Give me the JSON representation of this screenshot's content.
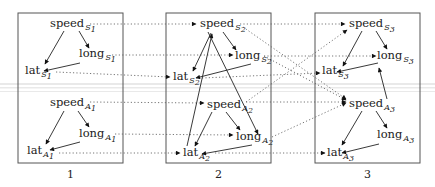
{
  "diagram": {
    "title": "",
    "panels": [
      {
        "id": "p1",
        "label": "1",
        "x": 18,
        "y": 13,
        "w": 105,
        "h": 150
      },
      {
        "id": "p2",
        "label": "2",
        "x": 166,
        "y": 13,
        "w": 105,
        "h": 150
      },
      {
        "id": "p3",
        "label": "3",
        "x": 315,
        "y": 13,
        "w": 105,
        "h": 150
      }
    ],
    "nodes": [
      {
        "id": "speedS1",
        "base": "speed",
        "sub": "S",
        "idx": "1",
        "x": 50,
        "y": 27
      },
      {
        "id": "longS1",
        "base": "long",
        "sub": "S",
        "idx": "1",
        "x": 79,
        "y": 57
      },
      {
        "id": "latS1",
        "base": "lat",
        "sub": "S",
        "idx": "1",
        "x": 25,
        "y": 74
      },
      {
        "id": "speedA1",
        "base": "speed",
        "sub": "A",
        "idx": "1",
        "x": 50,
        "y": 106
      },
      {
        "id": "longA1",
        "base": "long",
        "sub": "A",
        "idx": "1",
        "x": 79,
        "y": 137
      },
      {
        "id": "latA1",
        "base": "lat",
        "sub": "A",
        "idx": "1",
        "x": 27,
        "y": 154
      },
      {
        "id": "speedS2",
        "base": "speed",
        "sub": "S",
        "idx": "2",
        "x": 200,
        "y": 27
      },
      {
        "id": "longS2",
        "base": "long",
        "sub": "S",
        "idx": "2",
        "x": 235,
        "y": 59
      },
      {
        "id": "latS2",
        "base": "lat",
        "sub": "S",
        "idx": "2",
        "x": 173,
        "y": 80
      },
      {
        "id": "speedA2",
        "base": "speed",
        "sub": "A",
        "idx": "2",
        "x": 207,
        "y": 108
      },
      {
        "id": "longA2",
        "base": "long",
        "sub": "A",
        "idx": "2",
        "x": 236,
        "y": 140
      },
      {
        "id": "latA2",
        "base": "lat",
        "sub": "A",
        "idx": "2",
        "x": 183,
        "y": 156
      },
      {
        "id": "speedS3",
        "base": "speed",
        "sub": "S",
        "idx": "3",
        "x": 349,
        "y": 27
      },
      {
        "id": "longS3",
        "base": "long",
        "sub": "S",
        "idx": "3",
        "x": 377,
        "y": 59
      },
      {
        "id": "latS3",
        "base": "lat",
        "sub": "S",
        "idx": "3",
        "x": 322,
        "y": 74
      },
      {
        "id": "speedA3",
        "base": "speed",
        "sub": "A",
        "idx": "3",
        "x": 349,
        "y": 107
      },
      {
        "id": "longA3",
        "base": "long",
        "sub": "A",
        "idx": "3",
        "x": 377,
        "y": 138
      },
      {
        "id": "latA3",
        "base": "lat",
        "sub": "A",
        "idx": "3",
        "x": 327,
        "y": 156
      }
    ],
    "solid_edges": [
      [
        64,
        31,
        45,
        64
      ],
      [
        79,
        31,
        89,
        48
      ],
      [
        80,
        63,
        44,
        71
      ],
      [
        64,
        111,
        46,
        144
      ],
      [
        78,
        111,
        89,
        127
      ],
      [
        80,
        142,
        50,
        150
      ],
      [
        211,
        33,
        193,
        71
      ],
      [
        223,
        32,
        236,
        50
      ],
      [
        251,
        64,
        196,
        78
      ],
      [
        212,
        112,
        195,
        146
      ],
      [
        226,
        112,
        240,
        130
      ],
      [
        252,
        145,
        202,
        154
      ],
      [
        187,
        146,
        212,
        34
      ],
      [
        208,
        32,
        258,
        134
      ],
      [
        362,
        31,
        343,
        66
      ],
      [
        376,
        31,
        387,
        49
      ],
      [
        378,
        63,
        337,
        72
      ],
      [
        362,
        111,
        342,
        145
      ],
      [
        376,
        111,
        387,
        128
      ],
      [
        379,
        144,
        342,
        153
      ],
      [
        387,
        99,
        379,
        68
      ]
    ],
    "dotted_edges": [
      [
        90,
        24,
        196,
        24
      ],
      [
        112,
        55,
        233,
        55
      ],
      [
        56,
        72,
        170,
        77
      ],
      [
        90,
        102,
        204,
        103
      ],
      [
        115,
        134,
        233,
        135
      ],
      [
        59,
        153,
        180,
        153
      ],
      [
        240,
        24,
        345,
        24
      ],
      [
        264,
        56,
        376,
        56
      ],
      [
        202,
        78,
        320,
        73
      ],
      [
        246,
        102,
        346,
        102
      ],
      [
        272,
        137,
        346,
        103
      ],
      [
        215,
        153,
        325,
        153
      ],
      [
        243,
        27,
        346,
        99
      ],
      [
        264,
        56,
        346,
        100
      ],
      [
        246,
        102,
        347,
        30
      ]
    ],
    "bands": [
      {
        "y": 83,
        "h": 2
      },
      {
        "y": 87,
        "h": 1.5
      },
      {
        "y": 91,
        "h": 1
      }
    ]
  }
}
